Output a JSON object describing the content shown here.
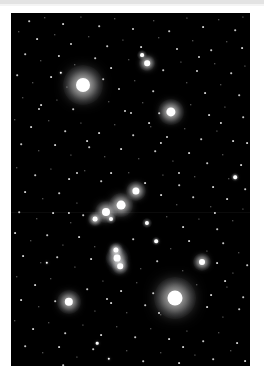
{
  "page": {
    "background_color": "#ffffff",
    "top_band_color": "#e3e3e3"
  },
  "photo": {
    "title": "Orion constellation star field",
    "x": 11,
    "y": 13,
    "width": 239,
    "height": 353,
    "background_color": "#000000",
    "star_color": "#ffffff"
  },
  "chart_data": {
    "type": "scatter",
    "xlabel": "",
    "ylabel": "",
    "xlim": [
      0,
      239
    ],
    "ylim": [
      0,
      353
    ],
    "grid": false,
    "legend": "none",
    "note": "Positions are pixel coordinates inside the photograph; size is apparent visual magnitude rendered as a disc radius in px.",
    "named_stars": [
      {
        "name": "Betelgeuse",
        "x": 72,
        "y": 72,
        "r": 7.0,
        "glow": 20
      },
      {
        "name": "Rigel",
        "x": 164,
        "y": 285,
        "r": 7.5,
        "glow": 21
      },
      {
        "name": "Bellatrix",
        "x": 160,
        "y": 99,
        "r": 4.6,
        "glow": 13
      },
      {
        "name": "Saiph",
        "x": 58,
        "y": 289,
        "r": 4.2,
        "glow": 12
      },
      {
        "name": "Alnilam",
        "x": 110,
        "y": 192,
        "r": 4.4,
        "glow": 12
      },
      {
        "name": "Alnitak",
        "x": 95,
        "y": 199,
        "r": 4.0,
        "glow": 11
      },
      {
        "name": "Mintaka",
        "x": 125,
        "y": 178,
        "r": 3.6,
        "glow": 10
      },
      {
        "name": "Meissa",
        "x": 136,
        "y": 50,
        "r": 2.8,
        "glow": 8
      },
      {
        "name": "Phi1 Orionis",
        "x": 131,
        "y": 42,
        "r": 1.9,
        "glow": 5
      },
      {
        "name": "M42 Trapezium",
        "x": 106,
        "y": 245,
        "r": 3.4,
        "glow": 11
      },
      {
        "name": "42 Orionis",
        "x": 105,
        "y": 237,
        "r": 2.6,
        "glow": 7
      },
      {
        "name": "Iota Orionis",
        "x": 109,
        "y": 253,
        "r": 2.8,
        "glow": 8
      },
      {
        "name": "Eta Orionis",
        "x": 84,
        "y": 206,
        "r": 2.4,
        "glow": 7
      },
      {
        "name": "Pi3 Orionis",
        "x": 191,
        "y": 249,
        "r": 3.0,
        "glow": 9
      },
      {
        "name": "Sigma Orionis",
        "x": 100,
        "y": 206,
        "r": 2.0,
        "glow": 5
      },
      {
        "name": "29 Orionis",
        "x": 136,
        "y": 210,
        "r": 2.1,
        "glow": 5
      },
      {
        "name": "Tau Orionis",
        "x": 145,
        "y": 228,
        "r": 1.8,
        "glow": 4
      },
      {
        "name": "Mu Orionis",
        "x": 224,
        "y": 164,
        "r": 1.8,
        "glow": 4
      }
    ],
    "nebula": {
      "name": "Orion Nebula M42 glow",
      "x": 107,
      "y": 246,
      "rx": 13,
      "ry": 17,
      "color": "rgba(190,200,215,0.17)"
    },
    "field_stars": [
      {
        "x": 18,
        "y": 8,
        "r": 0.8
      },
      {
        "x": 34,
        "y": 5,
        "r": 0.7
      },
      {
        "x": 52,
        "y": 11,
        "r": 0.9
      },
      {
        "x": 70,
        "y": 4,
        "r": 0.6
      },
      {
        "x": 88,
        "y": 13,
        "r": 0.8
      },
      {
        "x": 104,
        "y": 6,
        "r": 0.7
      },
      {
        "x": 122,
        "y": 16,
        "r": 1.0
      },
      {
        "x": 143,
        "y": 8,
        "r": 0.7
      },
      {
        "x": 158,
        "y": 18,
        "r": 0.8
      },
      {
        "x": 176,
        "y": 5,
        "r": 0.6
      },
      {
        "x": 192,
        "y": 14,
        "r": 0.9
      },
      {
        "x": 208,
        "y": 7,
        "r": 0.7
      },
      {
        "x": 224,
        "y": 17,
        "r": 0.8
      },
      {
        "x": 232,
        "y": 4,
        "r": 0.6
      },
      {
        "x": 8,
        "y": 19,
        "r": 0.7
      },
      {
        "x": 26,
        "y": 26,
        "r": 0.9
      },
      {
        "x": 44,
        "y": 22,
        "r": 0.7
      },
      {
        "x": 60,
        "y": 31,
        "r": 1.0
      },
      {
        "x": 78,
        "y": 24,
        "r": 0.7
      },
      {
        "x": 96,
        "y": 33,
        "r": 0.8
      },
      {
        "x": 112,
        "y": 27,
        "r": 0.6
      },
      {
        "x": 130,
        "y": 34,
        "r": 0.9
      },
      {
        "x": 148,
        "y": 25,
        "r": 0.7
      },
      {
        "x": 166,
        "y": 36,
        "r": 1.0
      },
      {
        "x": 182,
        "y": 28,
        "r": 0.7
      },
      {
        "x": 200,
        "y": 37,
        "r": 0.8
      },
      {
        "x": 216,
        "y": 29,
        "r": 0.7
      },
      {
        "x": 231,
        "y": 35,
        "r": 0.9
      },
      {
        "x": 14,
        "y": 41,
        "r": 0.8
      },
      {
        "x": 30,
        "y": 48,
        "r": 0.7
      },
      {
        "x": 48,
        "y": 43,
        "r": 1.1
      },
      {
        "x": 64,
        "y": 52,
        "r": 0.7
      },
      {
        "x": 84,
        "y": 45,
        "r": 0.8
      },
      {
        "x": 100,
        "y": 55,
        "r": 0.9
      },
      {
        "x": 118,
        "y": 47,
        "r": 0.7
      },
      {
        "x": 152,
        "y": 57,
        "r": 0.8
      },
      {
        "x": 170,
        "y": 49,
        "r": 0.6
      },
      {
        "x": 186,
        "y": 58,
        "r": 1.0
      },
      {
        "x": 204,
        "y": 51,
        "r": 0.7
      },
      {
        "x": 220,
        "y": 60,
        "r": 0.8
      },
      {
        "x": 234,
        "y": 53,
        "r": 0.6
      },
      {
        "x": 6,
        "y": 62,
        "r": 0.8
      },
      {
        "x": 22,
        "y": 70,
        "r": 0.7
      },
      {
        "x": 40,
        "y": 64,
        "r": 0.9
      },
      {
        "x": 56,
        "y": 74,
        "r": 0.6
      },
      {
        "x": 92,
        "y": 66,
        "r": 0.8
      },
      {
        "x": 108,
        "y": 76,
        "r": 1.0
      },
      {
        "x": 124,
        "y": 68,
        "r": 0.7
      },
      {
        "x": 142,
        "y": 78,
        "r": 0.8
      },
      {
        "x": 176,
        "y": 70,
        "r": 0.7
      },
      {
        "x": 194,
        "y": 80,
        "r": 0.9
      },
      {
        "x": 210,
        "y": 72,
        "r": 0.7
      },
      {
        "x": 228,
        "y": 82,
        "r": 0.8
      },
      {
        "x": 12,
        "y": 85,
        "r": 0.7
      },
      {
        "x": 30,
        "y": 92,
        "r": 0.9
      },
      {
        "x": 46,
        "y": 87,
        "r": 0.6
      },
      {
        "x": 62,
        "y": 96,
        "r": 0.8
      },
      {
        "x": 98,
        "y": 89,
        "r": 0.7
      },
      {
        "x": 114,
        "y": 98,
        "r": 1.0
      },
      {
        "x": 132,
        "y": 90,
        "r": 0.7
      },
      {
        "x": 148,
        "y": 100,
        "r": 0.8
      },
      {
        "x": 180,
        "y": 92,
        "r": 0.7
      },
      {
        "x": 198,
        "y": 102,
        "r": 0.9
      },
      {
        "x": 214,
        "y": 94,
        "r": 0.6
      },
      {
        "x": 232,
        "y": 104,
        "r": 0.8
      },
      {
        "x": 4,
        "y": 107,
        "r": 0.7
      },
      {
        "x": 20,
        "y": 114,
        "r": 0.9
      },
      {
        "x": 38,
        "y": 108,
        "r": 0.7
      },
      {
        "x": 54,
        "y": 118,
        "r": 0.8
      },
      {
        "x": 70,
        "y": 110,
        "r": 0.6
      },
      {
        "x": 88,
        "y": 120,
        "r": 0.9
      },
      {
        "x": 104,
        "y": 112,
        "r": 0.7
      },
      {
        "x": 122,
        "y": 122,
        "r": 0.8
      },
      {
        "x": 140,
        "y": 114,
        "r": 0.7
      },
      {
        "x": 156,
        "y": 124,
        "r": 1.0
      },
      {
        "x": 174,
        "y": 116,
        "r": 0.7
      },
      {
        "x": 190,
        "y": 126,
        "r": 0.8
      },
      {
        "x": 206,
        "y": 118,
        "r": 0.6
      },
      {
        "x": 222,
        "y": 128,
        "r": 0.9
      },
      {
        "x": 10,
        "y": 131,
        "r": 0.8
      },
      {
        "x": 28,
        "y": 138,
        "r": 0.7
      },
      {
        "x": 44,
        "y": 132,
        "r": 0.9
      },
      {
        "x": 60,
        "y": 142,
        "r": 0.6
      },
      {
        "x": 78,
        "y": 134,
        "r": 0.8
      },
      {
        "x": 94,
        "y": 144,
        "r": 0.7
      },
      {
        "x": 110,
        "y": 136,
        "r": 0.9
      },
      {
        "x": 128,
        "y": 146,
        "r": 0.7
      },
      {
        "x": 144,
        "y": 138,
        "r": 0.8
      },
      {
        "x": 162,
        "y": 148,
        "r": 0.6
      },
      {
        "x": 178,
        "y": 140,
        "r": 0.9
      },
      {
        "x": 196,
        "y": 150,
        "r": 0.8
      },
      {
        "x": 212,
        "y": 142,
        "r": 0.7
      },
      {
        "x": 230,
        "y": 152,
        "r": 0.9
      },
      {
        "x": 6,
        "y": 155,
        "r": 0.7
      },
      {
        "x": 24,
        "y": 162,
        "r": 0.8
      },
      {
        "x": 40,
        "y": 156,
        "r": 0.6
      },
      {
        "x": 58,
        "y": 166,
        "r": 0.9
      },
      {
        "x": 74,
        "y": 158,
        "r": 0.7
      },
      {
        "x": 90,
        "y": 168,
        "r": 0.8
      },
      {
        "x": 118,
        "y": 160,
        "r": 0.7
      },
      {
        "x": 134,
        "y": 170,
        "r": 0.9
      },
      {
        "x": 152,
        "y": 162,
        "r": 0.6
      },
      {
        "x": 168,
        "y": 172,
        "r": 0.8
      },
      {
        "x": 184,
        "y": 164,
        "r": 0.7
      },
      {
        "x": 202,
        "y": 174,
        "r": 0.9
      },
      {
        "x": 218,
        "y": 166,
        "r": 0.7
      },
      {
        "x": 234,
        "y": 176,
        "r": 0.8
      },
      {
        "x": 14,
        "y": 179,
        "r": 0.9
      },
      {
        "x": 32,
        "y": 186,
        "r": 0.7
      },
      {
        "x": 48,
        "y": 180,
        "r": 0.8
      },
      {
        "x": 66,
        "y": 190,
        "r": 0.6
      },
      {
        "x": 150,
        "y": 182,
        "r": 0.9
      },
      {
        "x": 166,
        "y": 192,
        "r": 0.7
      },
      {
        "x": 182,
        "y": 184,
        "r": 0.8
      },
      {
        "x": 200,
        "y": 194,
        "r": 0.7
      },
      {
        "x": 216,
        "y": 186,
        "r": 0.9
      },
      {
        "x": 232,
        "y": 196,
        "r": 0.6
      },
      {
        "x": 8,
        "y": 199,
        "r": 0.8
      },
      {
        "x": 26,
        "y": 206,
        "r": 0.7
      },
      {
        "x": 42,
        "y": 200,
        "r": 0.9
      },
      {
        "x": 60,
        "y": 210,
        "r": 0.7
      },
      {
        "x": 72,
        "y": 202,
        "r": 0.8
      },
      {
        "x": 156,
        "y": 204,
        "r": 0.7
      },
      {
        "x": 172,
        "y": 214,
        "r": 0.9
      },
      {
        "x": 188,
        "y": 206,
        "r": 0.6
      },
      {
        "x": 206,
        "y": 216,
        "r": 0.8
      },
      {
        "x": 222,
        "y": 208,
        "r": 0.7
      },
      {
        "x": 4,
        "y": 220,
        "r": 0.9
      },
      {
        "x": 20,
        "y": 228,
        "r": 0.7
      },
      {
        "x": 36,
        "y": 222,
        "r": 0.8
      },
      {
        "x": 52,
        "y": 232,
        "r": 0.6
      },
      {
        "x": 68,
        "y": 224,
        "r": 0.9
      },
      {
        "x": 84,
        "y": 234,
        "r": 0.7
      },
      {
        "x": 122,
        "y": 226,
        "r": 0.8
      },
      {
        "x": 160,
        "y": 236,
        "r": 0.7
      },
      {
        "x": 178,
        "y": 228,
        "r": 0.9
      },
      {
        "x": 196,
        "y": 238,
        "r": 0.6
      },
      {
        "x": 212,
        "y": 230,
        "r": 0.8
      },
      {
        "x": 228,
        "y": 240,
        "r": 0.7
      },
      {
        "x": 12,
        "y": 243,
        "r": 0.9
      },
      {
        "x": 30,
        "y": 250,
        "r": 0.7
      },
      {
        "x": 46,
        "y": 244,
        "r": 0.8
      },
      {
        "x": 64,
        "y": 254,
        "r": 0.6
      },
      {
        "x": 80,
        "y": 246,
        "r": 0.9
      },
      {
        "x": 130,
        "y": 256,
        "r": 0.7
      },
      {
        "x": 146,
        "y": 248,
        "r": 0.8
      },
      {
        "x": 172,
        "y": 258,
        "r": 0.7
      },
      {
        "x": 206,
        "y": 250,
        "r": 0.9
      },
      {
        "x": 222,
        "y": 260,
        "r": 0.6
      },
      {
        "x": 236,
        "y": 252,
        "r": 0.8
      },
      {
        "x": 6,
        "y": 264,
        "r": 0.7
      },
      {
        "x": 24,
        "y": 272,
        "r": 0.9
      },
      {
        "x": 40,
        "y": 266,
        "r": 0.7
      },
      {
        "x": 76,
        "y": 276,
        "r": 0.8
      },
      {
        "x": 92,
        "y": 268,
        "r": 0.6
      },
      {
        "x": 110,
        "y": 278,
        "r": 0.9
      },
      {
        "x": 126,
        "y": 270,
        "r": 0.7
      },
      {
        "x": 142,
        "y": 280,
        "r": 0.8
      },
      {
        "x": 186,
        "y": 272,
        "r": 0.7
      },
      {
        "x": 200,
        "y": 282,
        "r": 0.9
      },
      {
        "x": 216,
        "y": 274,
        "r": 0.6
      },
      {
        "x": 232,
        "y": 284,
        "r": 0.8
      },
      {
        "x": 10,
        "y": 287,
        "r": 0.9
      },
      {
        "x": 28,
        "y": 294,
        "r": 0.7
      },
      {
        "x": 44,
        "y": 288,
        "r": 0.8
      },
      {
        "x": 84,
        "y": 298,
        "r": 0.6
      },
      {
        "x": 100,
        "y": 290,
        "r": 0.9
      },
      {
        "x": 116,
        "y": 300,
        "r": 0.7
      },
      {
        "x": 134,
        "y": 292,
        "r": 0.8
      },
      {
        "x": 150,
        "y": 302,
        "r": 0.7
      },
      {
        "x": 196,
        "y": 294,
        "r": 0.9
      },
      {
        "x": 212,
        "y": 304,
        "r": 0.6
      },
      {
        "x": 228,
        "y": 296,
        "r": 0.8
      },
      {
        "x": 4,
        "y": 308,
        "r": 0.7
      },
      {
        "x": 22,
        "y": 316,
        "r": 0.9
      },
      {
        "x": 38,
        "y": 310,
        "r": 0.7
      },
      {
        "x": 54,
        "y": 320,
        "r": 0.8
      },
      {
        "x": 72,
        "y": 312,
        "r": 0.6
      },
      {
        "x": 90,
        "y": 322,
        "r": 0.9
      },
      {
        "x": 106,
        "y": 314,
        "r": 0.7
      },
      {
        "x": 124,
        "y": 324,
        "r": 0.8
      },
      {
        "x": 140,
        "y": 316,
        "r": 0.7
      },
      {
        "x": 158,
        "y": 326,
        "r": 0.9
      },
      {
        "x": 176,
        "y": 318,
        "r": 0.6
      },
      {
        "x": 192,
        "y": 328,
        "r": 0.8
      },
      {
        "x": 208,
        "y": 320,
        "r": 0.7
      },
      {
        "x": 226,
        "y": 330,
        "r": 0.9
      },
      {
        "x": 14,
        "y": 333,
        "r": 0.8
      },
      {
        "x": 32,
        "y": 340,
        "r": 0.7
      },
      {
        "x": 48,
        "y": 334,
        "r": 0.9
      },
      {
        "x": 66,
        "y": 344,
        "r": 0.6
      },
      {
        "x": 82,
        "y": 336,
        "r": 0.8
      },
      {
        "x": 98,
        "y": 346,
        "r": 1.2
      },
      {
        "x": 116,
        "y": 338,
        "r": 0.7
      },
      {
        "x": 132,
        "y": 348,
        "r": 0.8
      },
      {
        "x": 150,
        "y": 340,
        "r": 0.7
      },
      {
        "x": 168,
        "y": 350,
        "r": 0.9
      },
      {
        "x": 184,
        "y": 342,
        "r": 0.6
      },
      {
        "x": 202,
        "y": 346,
        "r": 0.8
      },
      {
        "x": 220,
        "y": 338,
        "r": 0.7
      },
      {
        "x": 234,
        "y": 348,
        "r": 0.9
      },
      {
        "x": 50,
        "y": 60,
        "r": 1.2
      },
      {
        "x": 150,
        "y": 130,
        "r": 1.1
      },
      {
        "x": 66,
        "y": 160,
        "r": 1.0
      },
      {
        "x": 210,
        "y": 110,
        "r": 1.1
      },
      {
        "x": 36,
        "y": 250,
        "r": 1.2
      },
      {
        "x": 148,
        "y": 300,
        "r": 1.0
      },
      {
        "x": 86,
        "y": 330,
        "r": 1.3
      },
      {
        "x": 204,
        "y": 200,
        "r": 1.1
      },
      {
        "x": 120,
        "y": 100,
        "r": 1.0
      },
      {
        "x": 58,
        "y": 200,
        "r": 1.1
      },
      {
        "x": 168,
        "y": 160,
        "r": 1.0
      },
      {
        "x": 100,
        "y": 160,
        "r": 0.9
      },
      {
        "x": 138,
        "y": 110,
        "r": 0.9
      },
      {
        "x": 188,
        "y": 44,
        "r": 1.0
      },
      {
        "x": 76,
        "y": 128,
        "r": 0.9
      },
      {
        "x": 28,
        "y": 96,
        "r": 1.0
      },
      {
        "x": 214,
        "y": 268,
        "r": 0.9
      },
      {
        "x": 96,
        "y": 286,
        "r": 1.0
      },
      {
        "x": 172,
        "y": 334,
        "r": 0.9
      },
      {
        "x": 52,
        "y": 352,
        "r": 0.8
      },
      {
        "x": 236,
        "y": 130,
        "r": 0.9
      }
    ]
  }
}
